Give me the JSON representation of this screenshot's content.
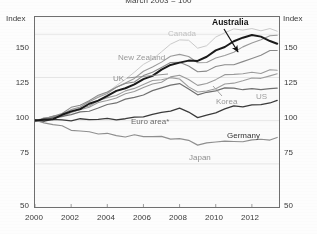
{
  "chart_data": {
    "type": "line",
    "title": "March 2003 = 100",
    "xlabel": "",
    "ylabel": "Index",
    "ylabel_right": "Index",
    "ylim": [
      50,
      160
    ],
    "yticks": [
      150,
      125,
      100,
      75,
      50
    ],
    "xlim": [
      2000,
      2013.5
    ],
    "xticks": [
      2000,
      2002,
      2004,
      2006,
      2008,
      2010,
      2012
    ],
    "grid": true,
    "legend_position": "inline-labels",
    "footnote_marker": "*",
    "series": [
      {
        "name": "Australia",
        "color": "#1a1a1a",
        "width": 2.0,
        "label_style": "callout",
        "x": [
          2000.0,
          2000.5,
          2001.0,
          2001.5,
          2002.0,
          2002.5,
          2003.0,
          2003.5,
          2004.0,
          2004.5,
          2005.0,
          2005.5,
          2006.0,
          2006.5,
          2007.0,
          2007.5,
          2008.0,
          2008.5,
          2009.0,
          2009.5,
          2010.0,
          2010.5,
          2011.0,
          2011.5,
          2012.0,
          2012.5,
          2013.0,
          2013.4
        ],
        "values": [
          100,
          100.5,
          101.5,
          103,
          105,
          107,
          109.5,
          112,
          114.5,
          116.5,
          119,
          121,
          124,
          126.5,
          129,
          132,
          134,
          134.5,
          135,
          137,
          140,
          143,
          146,
          148,
          150,
          148,
          146,
          145
        ]
      },
      {
        "name": "Canada",
        "color": "#c9c9c9",
        "width": 1.0,
        "label_style": "inline",
        "x": [
          2000.0,
          2000.5,
          2001.0,
          2001.5,
          2002.0,
          2002.5,
          2003.0,
          2003.5,
          2004.0,
          2004.5,
          2005.0,
          2005.5,
          2006.0,
          2006.5,
          2007.0,
          2007.5,
          2008.0,
          2008.5,
          2009.0,
          2009.5,
          2010.0,
          2010.5,
          2011.0,
          2011.5,
          2012.0,
          2012.5,
          2013.0,
          2013.4
        ],
        "values": [
          100,
          101,
          102.5,
          104,
          106,
          108,
          111,
          114,
          117,
          120,
          124,
          128,
          132,
          136,
          140,
          144,
          147,
          146,
          142,
          144,
          148,
          151,
          153,
          152,
          154,
          152,
          153,
          152
        ]
      },
      {
        "name": "New Zealand",
        "color": "#9a9a9a",
        "width": 1.1,
        "label_style": "inline",
        "x": [
          2000.0,
          2000.5,
          2001.0,
          2001.5,
          2002.0,
          2002.5,
          2003.0,
          2003.5,
          2004.0,
          2004.5,
          2005.0,
          2005.5,
          2006.0,
          2006.5,
          2007.0,
          2007.5,
          2008.0,
          2008.5,
          2009.0,
          2009.5,
          2010.0,
          2010.5,
          2011.0,
          2011.5,
          2012.0,
          2012.5,
          2013.0,
          2013.4
        ],
        "values": [
          100,
          101,
          102,
          104,
          106,
          108.5,
          111,
          113,
          116,
          119,
          122,
          125,
          128,
          131,
          134,
          137,
          139,
          137,
          133,
          134,
          136,
          138,
          140,
          142,
          145,
          147,
          149,
          150
        ]
      },
      {
        "name": "UK",
        "color": "#8a8a8a",
        "width": 1.1,
        "label_style": "inline-leader",
        "x": [
          2000.0,
          2000.5,
          2001.0,
          2001.5,
          2002.0,
          2002.5,
          2003.0,
          2003.5,
          2004.0,
          2004.5,
          2005.0,
          2005.5,
          2006.0,
          2006.5,
          2007.0,
          2007.5,
          2008.0,
          2008.5,
          2009.0,
          2009.5,
          2010.0,
          2010.5,
          2011.0,
          2011.5,
          2012.0,
          2012.5,
          2013.0,
          2013.4
        ],
        "values": [
          100,
          101,
          102.5,
          104.5,
          107,
          109,
          112,
          114.5,
          117,
          119,
          121,
          123,
          126,
          128,
          131,
          133,
          134,
          132,
          128,
          129,
          131,
          132,
          133,
          134,
          136,
          138,
          140,
          141
        ]
      },
      {
        "name": "Korea",
        "color": "#9a9a9a",
        "width": 1.1,
        "label_style": "inline",
        "x": [
          2000.0,
          2000.5,
          2001.0,
          2001.5,
          2002.0,
          2002.5,
          2003.0,
          2003.5,
          2004.0,
          2004.5,
          2005.0,
          2005.5,
          2006.0,
          2006.5,
          2007.0,
          2007.5,
          2008.0,
          2008.5,
          2009.0,
          2009.5,
          2010.0,
          2010.5,
          2011.0,
          2011.5,
          2012.0,
          2012.5,
          2013.0,
          2013.4
        ],
        "values": [
          100,
          100.5,
          101.5,
          103,
          104.5,
          106,
          108,
          110,
          112,
          113.5,
          115,
          117,
          119,
          121,
          123,
          125,
          126,
          124,
          120,
          122,
          124,
          126,
          127,
          127,
          128,
          128,
          129,
          129
        ]
      },
      {
        "name": "US",
        "color": "#9e9e9e",
        "width": 1.1,
        "label_style": "inline",
        "x": [
          2000.0,
          2000.5,
          2001.0,
          2001.5,
          2002.0,
          2002.5,
          2003.0,
          2003.5,
          2004.0,
          2004.5,
          2005.0,
          2005.5,
          2006.0,
          2006.5,
          2007.0,
          2007.5,
          2008.0,
          2008.5,
          2009.0,
          2009.5,
          2010.0,
          2010.5,
          2011.0,
          2011.5,
          2012.0,
          2012.5,
          2013.0,
          2013.4
        ],
        "values": [
          100,
          101,
          102,
          103.5,
          105,
          107,
          109,
          111,
          113,
          115,
          117,
          119,
          121,
          122.5,
          124,
          125,
          124,
          120,
          116,
          117,
          119,
          121,
          122,
          123,
          124,
          125,
          126,
          127
        ]
      },
      {
        "name": "Euro area*",
        "color": "#707070",
        "width": 1.2,
        "label_style": "inline",
        "x": [
          2000.0,
          2000.5,
          2001.0,
          2001.5,
          2002.0,
          2002.5,
          2003.0,
          2003.5,
          2004.0,
          2004.5,
          2005.0,
          2005.5,
          2006.0,
          2006.5,
          2007.0,
          2007.5,
          2008.0,
          2008.5,
          2009.0,
          2009.5,
          2010.0,
          2010.5,
          2011.0,
          2011.5,
          2012.0,
          2012.5,
          2013.0,
          2013.4
        ],
        "values": [
          100,
          100.5,
          101.5,
          102.5,
          103.5,
          104.5,
          106,
          107.5,
          109,
          110.5,
          112,
          113.5,
          115.5,
          117,
          119,
          120.5,
          121,
          119,
          115,
          116,
          117.5,
          118.5,
          119,
          118.5,
          118,
          118,
          118.5,
          118.5
        ]
      },
      {
        "name": "Germany",
        "color": "#3a3a3a",
        "width": 1.3,
        "label_style": "inline",
        "x": [
          2000.0,
          2000.5,
          2001.0,
          2001.5,
          2002.0,
          2002.5,
          2003.0,
          2003.5,
          2004.0,
          2004.5,
          2005.0,
          2005.5,
          2006.0,
          2006.5,
          2007.0,
          2007.5,
          2008.0,
          2008.5,
          2009.0,
          2009.5,
          2010.0,
          2010.5,
          2011.0,
          2011.5,
          2012.0,
          2012.5,
          2013.0,
          2013.4
        ],
        "values": [
          100,
          100,
          100.5,
          100.5,
          100.5,
          100.5,
          100.5,
          101,
          101,
          101,
          101,
          101.5,
          102.5,
          103.5,
          105,
          106,
          106.5,
          105,
          102,
          103,
          105,
          106.5,
          108,
          108.5,
          109,
          109.5,
          110.5,
          111
        ]
      },
      {
        "name": "Japan",
        "color": "#8f8f8f",
        "width": 1.2,
        "label_style": "inline",
        "x": [
          2000.0,
          2000.5,
          2001.0,
          2001.5,
          2002.0,
          2002.5,
          2003.0,
          2003.5,
          2004.0,
          2004.5,
          2005.0,
          2005.5,
          2006.0,
          2006.5,
          2007.0,
          2007.5,
          2008.0,
          2008.5,
          2009.0,
          2009.5,
          2010.0,
          2010.5,
          2011.0,
          2011.5,
          2012.0,
          2012.5,
          2013.0,
          2013.4
        ],
        "values": [
          100,
          99,
          97.5,
          96.5,
          95,
          94,
          93.5,
          92.5,
          92,
          91.5,
          91,
          91.5,
          91,
          90.5,
          90.5,
          90,
          89.5,
          88.5,
          86,
          86.5,
          88,
          88.5,
          87.5,
          88,
          88.5,
          89,
          89.5,
          90
        ]
      }
    ]
  },
  "labels": {
    "axis_left": "Index",
    "axis_right": "Index",
    "callout_australia": "Australia",
    "inline_canada": "Canada",
    "inline_new_zealand": "New Zealand",
    "inline_uk": "UK",
    "inline_korea": "Korea",
    "inline_us": "US",
    "inline_euro_area": "Euro area*",
    "inline_germany": "Germany",
    "inline_japan": "Japan"
  },
  "yticks": {
    "t0": "150",
    "t1": "125",
    "t2": "100",
    "t3": "75",
    "t4": "50"
  },
  "xticks": {
    "t0": "2000",
    "t1": "2002",
    "t2": "2004",
    "t3": "2006",
    "t4": "2008",
    "t5": "2010",
    "t6": "2012"
  }
}
